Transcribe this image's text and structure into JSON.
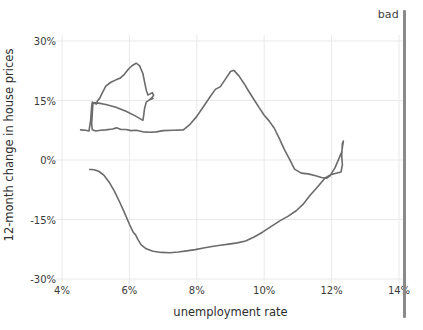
{
  "chart_data": {
    "type": "line",
    "title": "",
    "subtitle": "",
    "xlabel": "unemployment rate",
    "ylabel": "12-month change in house prices",
    "xlim": [
      3.5,
      15.0
    ],
    "ylim": [
      -33,
      33
    ],
    "xticks": [
      "4%",
      "6%",
      "8%",
      "10%",
      "12%",
      "14%"
    ],
    "xtick_values": [
      4,
      6,
      8,
      10,
      12,
      14
    ],
    "yticks": [
      "30%",
      "15%",
      "0%",
      "-15%",
      "-30%"
    ],
    "ytick_values": [
      30,
      15,
      0,
      -15,
      -30
    ],
    "grid": true,
    "legend": null,
    "annotations": [
      {
        "text": "bad",
        "position": "top-right",
        "marker": "vertical-bar"
      }
    ],
    "series": [
      {
        "name": "unemployment vs house prices path",
        "color": "#6b6b6b",
        "points": [
          [
            4.55,
            7.6
          ],
          [
            4.7,
            7.5
          ],
          [
            4.8,
            7.3
          ],
          [
            4.85,
            10.0
          ],
          [
            4.88,
            13.5
          ],
          [
            4.9,
            14.6
          ],
          [
            4.95,
            14.3
          ],
          [
            5.02,
            14.1
          ],
          [
            5.05,
            14.9
          ],
          [
            5.12,
            15.6
          ],
          [
            5.2,
            17.0
          ],
          [
            5.3,
            18.6
          ],
          [
            5.45,
            19.6
          ],
          [
            5.6,
            20.2
          ],
          [
            5.72,
            20.6
          ],
          [
            5.85,
            21.6
          ],
          [
            5.98,
            23.0
          ],
          [
            6.1,
            23.9
          ],
          [
            6.2,
            24.4
          ],
          [
            6.3,
            23.8
          ],
          [
            6.4,
            21.8
          ],
          [
            6.45,
            19.7
          ],
          [
            6.5,
            17.6
          ],
          [
            6.55,
            16.4
          ],
          [
            6.6,
            16.6
          ],
          [
            6.68,
            17.0
          ],
          [
            6.72,
            16.3
          ],
          [
            6.66,
            15.6
          ],
          [
            6.62,
            15.4
          ],
          [
            6.7,
            15.5
          ],
          [
            6.6,
            15.2
          ],
          [
            6.5,
            14.6
          ],
          [
            6.45,
            13.0
          ],
          [
            6.42,
            11.0
          ],
          [
            6.4,
            10.0
          ],
          [
            6.2,
            11.0
          ],
          [
            5.9,
            12.3
          ],
          [
            5.6,
            13.3
          ],
          [
            5.3,
            14.0
          ],
          [
            5.05,
            14.4
          ],
          [
            4.92,
            14.5
          ],
          [
            4.9,
            12.0
          ],
          [
            4.88,
            9.0
          ],
          [
            4.9,
            7.6
          ],
          [
            5.0,
            7.3
          ],
          [
            5.15,
            7.5
          ],
          [
            5.3,
            7.6
          ],
          [
            5.5,
            7.8
          ],
          [
            5.62,
            8.1
          ],
          [
            5.75,
            7.7
          ],
          [
            5.9,
            7.7
          ],
          [
            6.05,
            7.4
          ],
          [
            6.2,
            7.5
          ],
          [
            6.4,
            7.1
          ],
          [
            6.6,
            7.0
          ],
          [
            6.8,
            7.1
          ],
          [
            7.0,
            7.4
          ],
          [
            7.3,
            7.5
          ],
          [
            7.6,
            7.6
          ],
          [
            7.8,
            9.0
          ],
          [
            8.0,
            11.0
          ],
          [
            8.2,
            13.5
          ],
          [
            8.4,
            16.0
          ],
          [
            8.55,
            17.8
          ],
          [
            8.7,
            18.5
          ],
          [
            8.85,
            20.4
          ],
          [
            9.0,
            22.3
          ],
          [
            9.1,
            22.6
          ],
          [
            9.25,
            21.2
          ],
          [
            9.4,
            19.3
          ],
          [
            9.55,
            17.2
          ],
          [
            9.7,
            15.2
          ],
          [
            9.85,
            13.2
          ],
          [
            10.0,
            11.3
          ],
          [
            10.15,
            9.8
          ],
          [
            10.3,
            8.0
          ],
          [
            10.45,
            5.4
          ],
          [
            10.6,
            2.6
          ],
          [
            10.75,
            0.2
          ],
          [
            10.9,
            -2.3
          ],
          [
            11.1,
            -3.3
          ],
          [
            11.3,
            -3.5
          ],
          [
            11.5,
            -3.9
          ],
          [
            11.7,
            -4.4
          ],
          [
            11.85,
            -4.6
          ],
          [
            11.95,
            -4.0
          ],
          [
            12.1,
            -2.0
          ],
          [
            12.22,
            0.4
          ],
          [
            12.3,
            2.0
          ],
          [
            12.35,
            4.8
          ],
          [
            12.32,
            4.2
          ],
          [
            12.3,
            1.0
          ],
          [
            12.32,
            -1.2
          ],
          [
            12.28,
            -3.0
          ],
          [
            12.1,
            -3.4
          ],
          [
            11.95,
            -3.8
          ],
          [
            11.8,
            -4.6
          ],
          [
            11.6,
            -6.6
          ],
          [
            11.35,
            -9.0
          ],
          [
            11.15,
            -11.2
          ],
          [
            10.95,
            -12.8
          ],
          [
            10.7,
            -14.2
          ],
          [
            10.45,
            -15.4
          ],
          [
            10.2,
            -16.8
          ],
          [
            9.95,
            -18.2
          ],
          [
            9.7,
            -19.4
          ],
          [
            9.45,
            -20.4
          ],
          [
            9.2,
            -20.9
          ],
          [
            8.95,
            -21.2
          ],
          [
            8.7,
            -21.5
          ],
          [
            8.45,
            -21.8
          ],
          [
            8.2,
            -22.2
          ],
          [
            7.95,
            -22.6
          ],
          [
            7.7,
            -22.9
          ],
          [
            7.45,
            -23.2
          ],
          [
            7.2,
            -23.4
          ],
          [
            6.95,
            -23.3
          ],
          [
            6.7,
            -23.0
          ],
          [
            6.5,
            -22.4
          ],
          [
            6.35,
            -21.4
          ],
          [
            6.25,
            -20.0
          ],
          [
            6.18,
            -18.8
          ],
          [
            6.12,
            -18.3
          ],
          [
            6.0,
            -16.2
          ],
          [
            5.85,
            -13.2
          ],
          [
            5.7,
            -10.4
          ],
          [
            5.55,
            -7.8
          ],
          [
            5.4,
            -5.6
          ],
          [
            5.25,
            -3.9
          ],
          [
            5.1,
            -2.9
          ],
          [
            4.98,
            -2.5
          ],
          [
            4.9,
            -2.4
          ],
          [
            4.82,
            -2.4
          ]
        ]
      }
    ],
    "colors": {
      "line": "#6b6b6b",
      "grid": "#e9e9e9",
      "text": "#3a3a3a",
      "bad_bar": "#8a8a8a",
      "background": "#ffffff"
    }
  },
  "labels": {
    "bad": "bad"
  }
}
